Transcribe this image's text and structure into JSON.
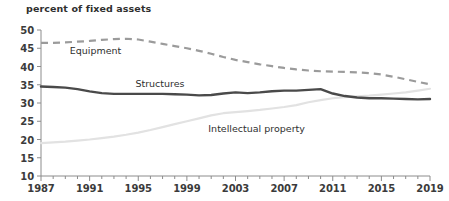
{
  "chart_data": {
    "type": "line",
    "title": "percent of fixed assets",
    "xlabel": "",
    "ylabel": "",
    "xlim": [
      1987,
      2019
    ],
    "ylim": [
      10,
      50
    ],
    "grid": false,
    "legend_position": "inline-annotations",
    "y_ticks": [
      50,
      45,
      40,
      35,
      30,
      25,
      20,
      15,
      10
    ],
    "x_ticks_major": [
      1987,
      1991,
      1995,
      1999,
      2003,
      2007,
      2011,
      2015,
      2019
    ],
    "x_minor_tick_interval": 1,
    "x": [
      1987,
      1988,
      1989,
      1990,
      1991,
      1992,
      1993,
      1994,
      1995,
      1996,
      1997,
      1998,
      1999,
      2000,
      2001,
      2002,
      2003,
      2004,
      2005,
      2006,
      2007,
      2008,
      2009,
      2010,
      2011,
      2012,
      2013,
      2014,
      2015,
      2016,
      2017,
      2018,
      2019
    ],
    "series": [
      {
        "name": "Equipment",
        "style": "dashed",
        "color": "#9b9b9b",
        "values": [
          46.5,
          46.5,
          46.6,
          46.8,
          47.0,
          47.3,
          47.5,
          47.6,
          47.4,
          46.8,
          46.2,
          45.6,
          45.0,
          44.3,
          43.5,
          42.6,
          41.8,
          41.2,
          40.6,
          40.1,
          39.6,
          39.2,
          38.9,
          38.7,
          38.6,
          38.5,
          38.4,
          38.2,
          37.8,
          37.2,
          36.5,
          35.8,
          35.1
        ]
      },
      {
        "name": "Structures",
        "style": "solid",
        "color": "#4a4a4a",
        "values": [
          34.5,
          34.4,
          34.2,
          33.8,
          33.2,
          32.7,
          32.5,
          32.5,
          32.5,
          32.5,
          32.5,
          32.4,
          32.3,
          32.1,
          32.2,
          32.6,
          32.9,
          32.7,
          32.9,
          33.2,
          33.4,
          33.4,
          33.6,
          33.8,
          32.6,
          31.9,
          31.5,
          31.3,
          31.3,
          31.2,
          31.1,
          31.0,
          31.1
        ],
        "annotations": [
          {
            "label": "Structures",
            "x": 1995,
            "y": 34.8
          }
        ]
      },
      {
        "name": "Intellectual property",
        "style": "solid",
        "color": "#e2e2e2",
        "values": [
          19.0,
          19.2,
          19.4,
          19.7,
          20.0,
          20.4,
          20.8,
          21.3,
          21.9,
          22.6,
          23.4,
          24.2,
          25.0,
          25.8,
          26.6,
          27.2,
          27.5,
          27.8,
          28.1,
          28.5,
          28.9,
          29.4,
          30.2,
          30.8,
          31.3,
          31.6,
          31.8,
          32.0,
          32.3,
          32.6,
          32.9,
          33.4,
          33.9
        ],
        "annotations": [
          {
            "label": "Intellectual property",
            "x": 2001,
            "y": 22.8
          }
        ]
      }
    ],
    "inline_labels": [
      {
        "name": "equipment-label",
        "text": "Equipment"
      },
      {
        "name": "structures-label",
        "text": "Structures"
      },
      {
        "name": "intellectual-property-label",
        "text": "Intellectual property"
      }
    ],
    "axis_color": "#8c8c8c",
    "text_color": "#3b3b3b"
  }
}
